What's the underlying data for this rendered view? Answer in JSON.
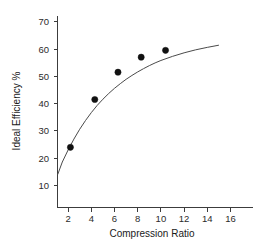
{
  "chart_data": {
    "type": "scatter",
    "title": "",
    "xlabel": "Compression Ratio",
    "ylabel": "Ideal Efficiency %",
    "xlim": [
      0.6,
      17.4
    ],
    "ylim": [
      6.5,
      73.5
    ],
    "xticks": [
      2,
      4,
      6,
      8,
      10,
      12,
      14,
      16
    ],
    "yticks": [
      10,
      20,
      30,
      40,
      50,
      60,
      70
    ],
    "grid": false,
    "legend": false,
    "series": [
      {
        "name": "Ideal Efficiency",
        "marker": "filled-circle",
        "color": "#111111",
        "x": [
          2.2,
          4.3,
          6.3,
          8.3,
          10.4
        ],
        "y": [
          24.0,
          41.5,
          51.5,
          57.0,
          59.5
        ]
      },
      {
        "name": "Fitted curve",
        "marker": "none",
        "color": "#4a4a4a",
        "x": [
          1.1,
          1.5,
          2.0,
          2.5,
          3.0,
          3.5,
          4.0,
          4.5,
          5.0,
          5.5,
          6.0,
          6.5,
          7.0,
          7.5,
          8.0,
          8.5,
          9.0,
          9.5,
          10.0,
          11.0,
          12.0,
          13.0,
          14.0,
          15.0
        ],
        "y": [
          14.0,
          18.6,
          23.0,
          27.0,
          30.6,
          33.8,
          36.7,
          39.3,
          41.6,
          43.7,
          45.6,
          47.3,
          48.9,
          50.3,
          51.6,
          52.8,
          53.9,
          54.9,
          55.8,
          57.3,
          58.6,
          59.7,
          60.6,
          61.4
        ]
      }
    ]
  },
  "axis": {
    "x_tick_labels": [
      "2",
      "4",
      "6",
      "8",
      "10",
      "12",
      "14",
      "16"
    ],
    "y_tick_labels": [
      "10",
      "20",
      "30",
      "40",
      "50",
      "60",
      "70"
    ],
    "x_title": "Compression Ratio",
    "y_title": "Ideal Efficiency %"
  },
  "colors": {
    "axis": "#3c3c3c",
    "curve": "#4a4a4a",
    "marker": "#111111",
    "background": "#ffffff",
    "text": "#1a1a1a"
  }
}
